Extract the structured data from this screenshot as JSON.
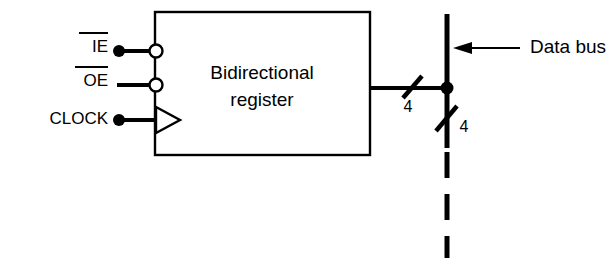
{
  "diagram": {
    "colors": {
      "ink": "#000000",
      "paper": "#ffffff"
    },
    "block": {
      "name": "bidirectional-register",
      "line1": "Bidirectional",
      "line2": "register"
    },
    "inputs": [
      {
        "id": "ie",
        "label": "IE",
        "overbar": true,
        "has_source_dot": true,
        "has_inverting_bubble": true,
        "terminal": "bubble"
      },
      {
        "id": "oe",
        "label": "OE",
        "overbar": true,
        "has_source_dot": false,
        "has_inverting_bubble": true,
        "terminal": "bubble"
      },
      {
        "id": "clock",
        "label": "CLOCK",
        "overbar": false,
        "has_source_dot": true,
        "has_inverting_bubble": false,
        "terminal": "edge-triangle"
      }
    ],
    "bus": {
      "label": "Data bus",
      "arrow_direction": "left",
      "junction_dot": true,
      "lower_segment_style": "dashed",
      "widths": [
        {
          "id": "register-to-bus",
          "value": "4"
        },
        {
          "id": "bus-downstream",
          "value": "4"
        }
      ]
    }
  }
}
